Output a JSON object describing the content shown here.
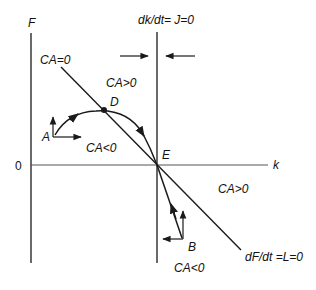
{
  "diagram": {
    "axes": {
      "y_label": "F",
      "x_label": "k",
      "origin_label": "0"
    },
    "curves": {
      "ca_zero": "CA=0",
      "dk_dt": "dk/dt= J=0",
      "df_dt": "dF/dt =L=0"
    },
    "regions": {
      "upper_positive": "CA>0",
      "upper_negative": "CA<0",
      "lower_positive": "CA>0",
      "lower_negative": "CA<0"
    },
    "points": {
      "a": "A",
      "b": "B",
      "d": "D",
      "e": "E"
    },
    "colors": {
      "line": "#1a1a1a",
      "axis": "#555555",
      "background": "#ffffff"
    }
  }
}
